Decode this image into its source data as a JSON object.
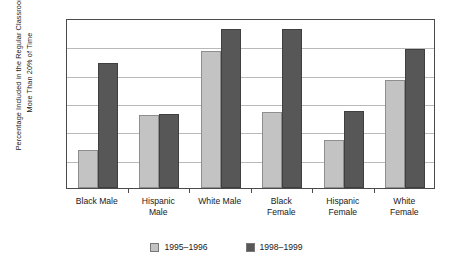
{
  "chart_data": {
    "type": "bar",
    "title": "",
    "subtitle": "",
    "xlabel": "",
    "ylabel": "Percentage Included in the Regular Classroom\nMore Than 20% of Time",
    "categories": [
      "Black Male",
      "Hispanic\nMale",
      "White Male",
      "Black\nFemale",
      "Hispanic\nFemale",
      "White\nFemale"
    ],
    "series": [
      {
        "name": "1995–1996",
        "color": "#c3c3c3",
        "values": [
          2.7,
          5.15,
          9.7,
          5.35,
          3.4,
          7.65
        ]
      },
      {
        "name": "1998–1999",
        "color": "#575757",
        "values": [
          8.8,
          5.25,
          11.2,
          11.2,
          5.45,
          9.8
        ]
      }
    ],
    "ylim": [
      0,
      12
    ],
    "yticks": [
      0,
      2,
      4,
      6,
      8,
      10,
      12
    ],
    "ytick_labels": [
      "0",
      "2",
      "4",
      "6",
      "8",
      "10",
      "12"
    ],
    "grid": true,
    "grid_axis": "y",
    "legend_position": "bottom"
  },
  "legend": {
    "items": [
      {
        "label": "1995–1996",
        "color": "#c3c3c3"
      },
      {
        "label": "1998–1999",
        "color": "#575757"
      }
    ]
  }
}
